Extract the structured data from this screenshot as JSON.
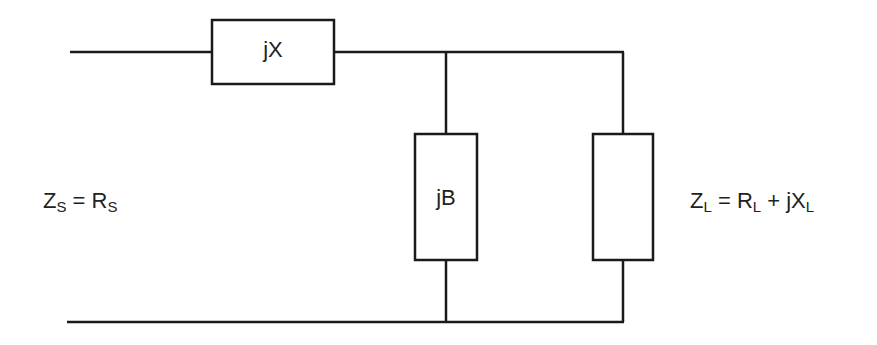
{
  "diagram": {
    "type": "L-section impedance matching network",
    "components": {
      "series": {
        "label": "jX"
      },
      "shunt": {
        "label": "jB"
      },
      "load": {
        "label": ""
      }
    },
    "source": {
      "lhs_main": "Z",
      "lhs_sub": "S",
      "eq": " = ",
      "rhs_main": "R",
      "rhs_sub": "S"
    },
    "load_eq": {
      "lhs_main": "Z",
      "lhs_sub": "L",
      "eq": " = ",
      "r_main": "R",
      "r_sub": "L",
      "plus": " + ",
      "x_main": "jX",
      "x_sub": "L"
    },
    "colors": {
      "line": "#1a1a1a",
      "background": "#ffffff",
      "text": "#222222"
    }
  }
}
